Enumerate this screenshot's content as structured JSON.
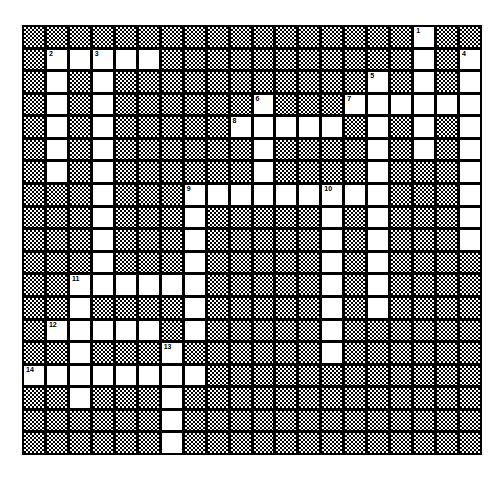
{
  "puzzle": {
    "cols": 20,
    "rows": 19,
    "colors": {
      "block": "#000000",
      "open": "#ffffff"
    },
    "open_cells": {
      "0": [
        17
      ],
      "1": [
        1,
        2,
        3,
        4,
        5,
        17,
        19
      ],
      "2": [
        1,
        3,
        15,
        17,
        19
      ],
      "3": [
        1,
        3,
        10,
        14,
        15,
        16,
        17,
        18,
        19
      ],
      "4": [
        1,
        3,
        9,
        10,
        11,
        12,
        13,
        15,
        17,
        19
      ],
      "5": [
        1,
        3,
        10,
        15,
        17,
        19
      ],
      "6": [
        1,
        3,
        10,
        15,
        19
      ],
      "7": [
        3,
        7,
        8,
        9,
        10,
        11,
        12,
        13,
        14,
        15,
        19
      ],
      "8": [
        3,
        7,
        13,
        15,
        19
      ],
      "9": [
        3,
        7,
        13,
        15,
        19
      ],
      "10": [
        3,
        7,
        13,
        15
      ],
      "11": [
        2,
        3,
        4,
        5,
        6,
        7,
        13,
        15
      ],
      "12": [
        2,
        7,
        13,
        15
      ],
      "13": [
        1,
        2,
        3,
        4,
        5,
        7,
        13
      ],
      "14": [
        2,
        6,
        13
      ],
      "15": [
        0,
        1,
        2,
        3,
        4,
        5,
        6,
        7
      ],
      "16": [
        2,
        6
      ],
      "17": [
        6
      ],
      "18": [
        6
      ]
    },
    "numbers": [
      {
        "n": "1",
        "row": 0,
        "col": 17
      },
      {
        "n": "2",
        "row": 1,
        "col": 1
      },
      {
        "n": "3",
        "row": 1,
        "col": 3
      },
      {
        "n": "4",
        "row": 1,
        "col": 19
      },
      {
        "n": "5",
        "row": 2,
        "col": 15
      },
      {
        "n": "6",
        "row": 3,
        "col": 10
      },
      {
        "n": "7",
        "row": 3,
        "col": 14
      },
      {
        "n": "8",
        "row": 4,
        "col": 9
      },
      {
        "n": "9",
        "row": 7,
        "col": 7
      },
      {
        "n": "10",
        "row": 7,
        "col": 13
      },
      {
        "n": "11",
        "row": 11,
        "col": 2
      },
      {
        "n": "12",
        "row": 13,
        "col": 1
      },
      {
        "n": "13",
        "row": 14,
        "col": 6
      },
      {
        "n": "14",
        "row": 15,
        "col": 0
      }
    ]
  }
}
